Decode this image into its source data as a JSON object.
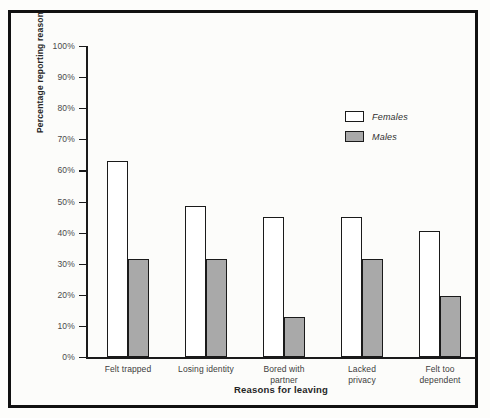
{
  "chart_data": {
    "type": "bar",
    "title": "",
    "xlabel": "Reasons for leaving",
    "ylabel": "Percentage reporting reason",
    "categories": [
      "Felt trapped",
      "Losing identity",
      "Bored with\npartner",
      "Lacked\nprivacy",
      "Felt too\ndependent"
    ],
    "series": [
      {
        "name": "Females",
        "color": "#ffffff",
        "values": [
          63,
          48.5,
          45,
          45,
          40.5
        ]
      },
      {
        "name": "Males",
        "color": "#a9a9a9",
        "values": [
          31.5,
          31.5,
          13,
          31.5,
          19.5
        ]
      }
    ],
    "ylim": [
      0,
      100
    ],
    "ytick_labels": [
      "100%",
      "90%",
      "80%",
      "70%",
      "60%",
      "50%",
      "40%",
      "30%",
      "20%",
      "10%",
      "0%"
    ],
    "ytick_values": [
      100,
      90,
      80,
      70,
      60,
      50,
      40,
      30,
      20,
      10,
      0
    ],
    "grid": false,
    "legend_position": "upper right"
  },
  "legend": {
    "items": [
      {
        "label": "Females"
      },
      {
        "label": "Males"
      }
    ]
  }
}
